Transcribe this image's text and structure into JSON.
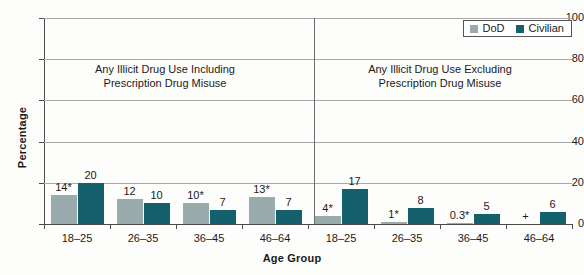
{
  "chart_data": {
    "type": "bar",
    "title": "",
    "xlabel": "Age Group",
    "ylabel": "Percentage",
    "ylim": [
      0,
      100
    ],
    "yticks": [
      0,
      20,
      40,
      60,
      80,
      100
    ],
    "grid": true,
    "legend_position": "top-right",
    "categories": [
      "18–25",
      "26–35",
      "36–45",
      "46–64"
    ],
    "legend": [
      {
        "name": "DoD",
        "color": "#9aabae"
      },
      {
        "name": "Civilian",
        "color": "#15606d"
      }
    ],
    "panels": [
      {
        "caption_line1": "Any Illicit Drug Use Including",
        "caption_line2": "Prescription Drug Misuse",
        "series": [
          {
            "name": "DoD",
            "color": "#9aabae",
            "values": [
              14,
              12,
              10,
              13
            ],
            "labels": [
              "14*",
              "12",
              "10*",
              "13*"
            ]
          },
          {
            "name": "Civilian",
            "color": "#15606d",
            "values": [
              20,
              10,
              7,
              7
            ],
            "labels": [
              "20",
              "10",
              "7",
              "7"
            ]
          }
        ]
      },
      {
        "caption_line1": "Any Illicit Drug Use Excluding",
        "caption_line2": "Prescription Drug Misuse",
        "series": [
          {
            "name": "DoD",
            "color": "#9aabae",
            "values": [
              4,
              1,
              0.3,
              0
            ],
            "labels": [
              "4*",
              "1*",
              "0.3*",
              "+"
            ]
          },
          {
            "name": "Civilian",
            "color": "#15606d",
            "values": [
              17,
              8,
              5,
              6
            ],
            "labels": [
              "17",
              "8",
              "5",
              "6"
            ]
          }
        ]
      }
    ]
  }
}
